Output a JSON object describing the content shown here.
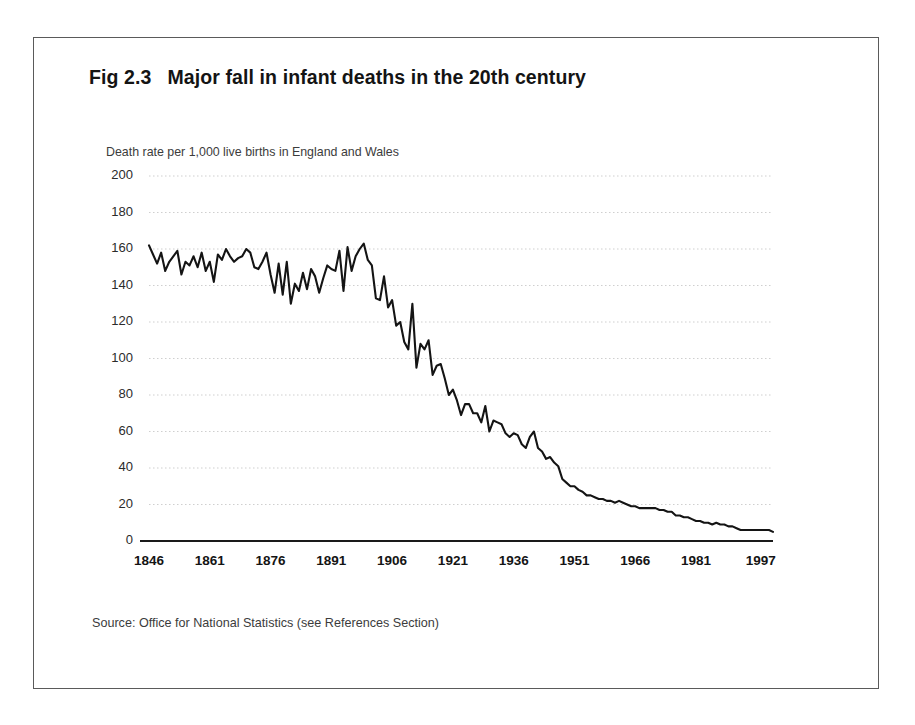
{
  "figure": {
    "label": "Fig 2.3",
    "title": "Major fall in infant deaths in the 20th century",
    "source_note": "Source: Office for National Statistics (see References Section)"
  },
  "chart_data": {
    "type": "line",
    "title": "Major fall in infant deaths in the 20th century",
    "subtitle": "Death rate per 1,000 live births in England and Wales",
    "xlabel": "",
    "ylabel": "Death rate per 1,000 live births in England and Wales",
    "xlim": [
      1846,
      2000
    ],
    "ylim": [
      0,
      200
    ],
    "ytick_values": [
      0,
      20,
      40,
      60,
      80,
      100,
      120,
      140,
      160,
      180,
      200
    ],
    "ytick_labels": [
      "0",
      "20",
      "40",
      "60",
      "80",
      "100",
      "120",
      "140",
      "160",
      "180",
      "200"
    ],
    "xtick_values": [
      1846,
      1861,
      1876,
      1891,
      1906,
      1921,
      1936,
      1951,
      1966,
      1981,
      1997
    ],
    "xtick_labels": [
      "1846",
      "1861",
      "1876",
      "1891",
      "1906",
      "1921",
      "1936",
      "1951",
      "1966",
      "1981",
      "1997"
    ],
    "grid": "horizontal-dotted",
    "legend": "none",
    "line_color": "#141414",
    "series": [
      {
        "name": "Infant mortality rate, England and Wales",
        "x": [
          1846,
          1847,
          1848,
          1849,
          1850,
          1851,
          1852,
          1853,
          1854,
          1855,
          1856,
          1857,
          1858,
          1859,
          1860,
          1861,
          1862,
          1863,
          1864,
          1865,
          1866,
          1867,
          1868,
          1869,
          1870,
          1871,
          1872,
          1873,
          1874,
          1875,
          1876,
          1877,
          1878,
          1879,
          1880,
          1881,
          1882,
          1883,
          1884,
          1885,
          1886,
          1887,
          1888,
          1889,
          1890,
          1891,
          1892,
          1893,
          1894,
          1895,
          1896,
          1897,
          1898,
          1899,
          1900,
          1901,
          1902,
          1903,
          1904,
          1905,
          1906,
          1907,
          1908,
          1909,
          1910,
          1911,
          1912,
          1913,
          1914,
          1915,
          1916,
          1917,
          1918,
          1919,
          1920,
          1921,
          1922,
          1923,
          1924,
          1925,
          1926,
          1927,
          1928,
          1929,
          1930,
          1931,
          1932,
          1933,
          1934,
          1935,
          1936,
          1937,
          1938,
          1939,
          1940,
          1941,
          1942,
          1943,
          1944,
          1945,
          1946,
          1947,
          1948,
          1949,
          1950,
          1951,
          1952,
          1953,
          1954,
          1955,
          1956,
          1957,
          1958,
          1959,
          1960,
          1961,
          1962,
          1963,
          1964,
          1965,
          1966,
          1967,
          1968,
          1969,
          1970,
          1971,
          1972,
          1973,
          1974,
          1975,
          1976,
          1977,
          1978,
          1979,
          1980,
          1981,
          1982,
          1983,
          1984,
          1985,
          1986,
          1987,
          1988,
          1989,
          1990,
          1991,
          1992,
          1993,
          1994,
          1995,
          1996,
          1997,
          1998,
          1999,
          2000
        ],
        "values": [
          162,
          157,
          152,
          158,
          148,
          153,
          156,
          159,
          146,
          153,
          151,
          156,
          150,
          158,
          148,
          153,
          142,
          157,
          154,
          160,
          156,
          153,
          155,
          156,
          160,
          158,
          150,
          149,
          153,
          158,
          146,
          136,
          152,
          135,
          153,
          130,
          141,
          137,
          147,
          138,
          149,
          145,
          136,
          144,
          151,
          149,
          148,
          159,
          137,
          161,
          148,
          156,
          160,
          163,
          154,
          151,
          133,
          132,
          145,
          128,
          132,
          118,
          120,
          109,
          105,
          130,
          95,
          108,
          105,
          110,
          91,
          96,
          97,
          89,
          80,
          83,
          77,
          69,
          75,
          75,
          70,
          70,
          65,
          74,
          60,
          66,
          65,
          64,
          59,
          57,
          59,
          58,
          53,
          51,
          57,
          60,
          51,
          49,
          45,
          46,
          43,
          41,
          34,
          32,
          30,
          30,
          28,
          27,
          25,
          25,
          24,
          23,
          23,
          22,
          22,
          21,
          22,
          21,
          20,
          19,
          19,
          18,
          18,
          18,
          18,
          18,
          17,
          17,
          16,
          16,
          14,
          14,
          13,
          13,
          12,
          11,
          11,
          10,
          10,
          9,
          10,
          9,
          9,
          8,
          8,
          7,
          6,
          6,
          6,
          6,
          6,
          6,
          6,
          6,
          5
        ]
      }
    ]
  }
}
